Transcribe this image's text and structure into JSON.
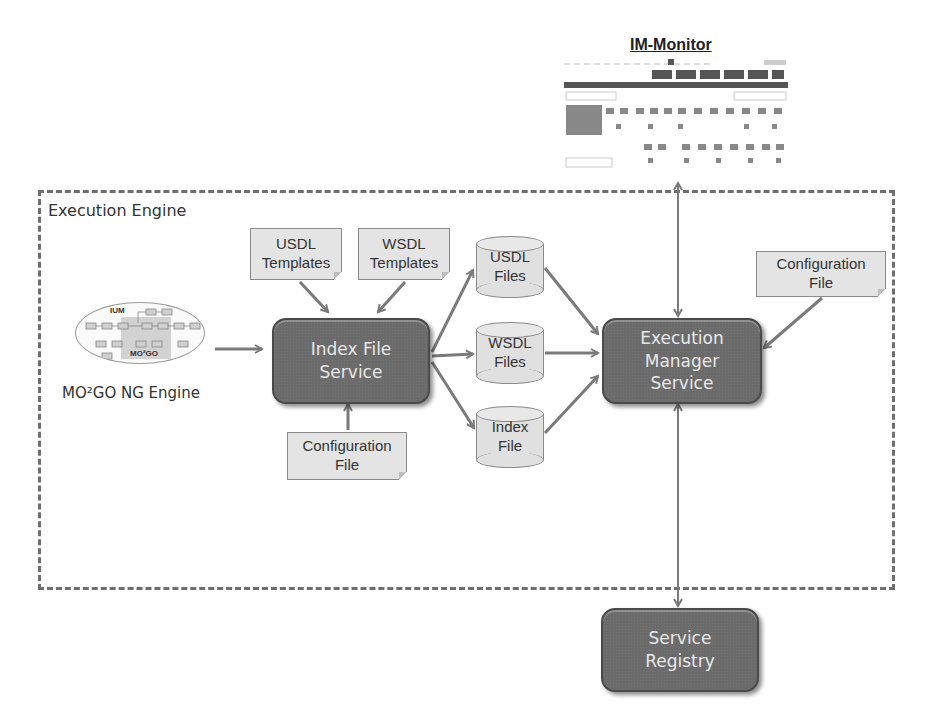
{
  "diagram": {
    "frame": {
      "label": "Execution Engine"
    },
    "monitor": {
      "title": "IM-Monitor",
      "tabs": 6,
      "panels": 10
    },
    "source": {
      "caption": "MO²GO NG Engine",
      "graphic_labels": {
        "top": "IUM",
        "bottom": "MO²GO"
      }
    },
    "services": {
      "index_file": {
        "line1": "Index File",
        "line2": "Service"
      },
      "execution_manager": {
        "line1": "Execution",
        "line2": "Manager",
        "line3": "Service"
      },
      "registry": {
        "line1": "Service",
        "line2": "Registry"
      }
    },
    "notes": {
      "usdl_templates": {
        "line1": "USDL",
        "line2": "Templates"
      },
      "wsdl_templates": {
        "line1": "WSDL",
        "line2": "Templates"
      },
      "config_index": {
        "line1": "Configuration",
        "line2": "File"
      },
      "config_exec": {
        "line1": "Configuration",
        "line2": "File"
      }
    },
    "stores": {
      "usdl_files": {
        "line1": "USDL",
        "line2": "Files"
      },
      "wsdl_files": {
        "line1": "WSDL",
        "line2": "Files"
      },
      "index_file": {
        "line1": "Index",
        "line2": "File"
      }
    },
    "edges": [
      {
        "from": "MO²GO NG Engine",
        "to": "Index File Service",
        "type": "arrow"
      },
      {
        "from": "USDL Templates",
        "to": "Index File Service",
        "type": "arrow"
      },
      {
        "from": "WSDL Templates",
        "to": "Index File Service",
        "type": "arrow"
      },
      {
        "from": "Configuration File",
        "to": "Index File Service",
        "type": "arrow"
      },
      {
        "from": "Index File Service",
        "to": "USDL Files",
        "type": "arrow"
      },
      {
        "from": "Index File Service",
        "to": "WSDL Files",
        "type": "arrow"
      },
      {
        "from": "Index File Service",
        "to": "Index File",
        "type": "arrow"
      },
      {
        "from": "USDL Files",
        "to": "Execution Manager Service",
        "type": "arrow"
      },
      {
        "from": "WSDL Files",
        "to": "Execution Manager Service",
        "type": "arrow"
      },
      {
        "from": "Index File",
        "to": "Execution Manager Service",
        "type": "arrow"
      },
      {
        "from": "Configuration File",
        "to": "Execution Manager Service",
        "type": "arrow"
      },
      {
        "from": "Execution Manager Service",
        "to": "IM-Monitor",
        "type": "bidirectional"
      },
      {
        "from": "Execution Manager Service",
        "to": "Service Registry",
        "type": "bidirectional"
      }
    ],
    "colors": {
      "service_fill": "#6b6b6b",
      "note_fill": "#e4e4e4",
      "arrow": "#7a7a7a",
      "frame": "#6e6e6e"
    }
  }
}
